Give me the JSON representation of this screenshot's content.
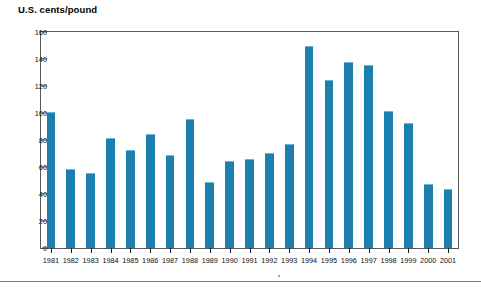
{
  "figure": {
    "axis_title": "U.S. cents/pound",
    "bar_color": "#1c7fae",
    "bar_highlight_color": "#6fb4d4",
    "frame_color": "#595959",
    "rule_color": "#3f94b0",
    "background": "#ffffff"
  },
  "chart_data": {
    "type": "bar",
    "title": "",
    "subtitle": "",
    "xlabel": "",
    "ylabel": "U.S. cents/pound",
    "ylim": [
      0,
      160
    ],
    "ytick_step": 20,
    "yticks": [
      0,
      20,
      40,
      60,
      80,
      100,
      120,
      140,
      160
    ],
    "ytick_labels": [
      "0",
      "20",
      "40",
      "60",
      "80",
      "100",
      "120",
      "140",
      "160"
    ],
    "grid": false,
    "legend": null,
    "legend_position": "none",
    "categories": [
      "1981",
      "1982",
      "1983",
      "1984",
      "1985",
      "1986",
      "1987",
      "1988",
      "1989",
      "1990",
      "1991",
      "1992",
      "1993",
      "1994",
      "1995",
      "1996",
      "1997",
      "1998",
      "1999",
      "2000",
      "2001"
    ],
    "values": [
      100,
      58,
      55,
      81,
      72,
      84,
      68,
      95,
      48,
      64,
      65,
      70,
      76,
      149,
      124,
      137,
      135,
      101,
      92,
      47,
      43
    ],
    "annotations": []
  }
}
